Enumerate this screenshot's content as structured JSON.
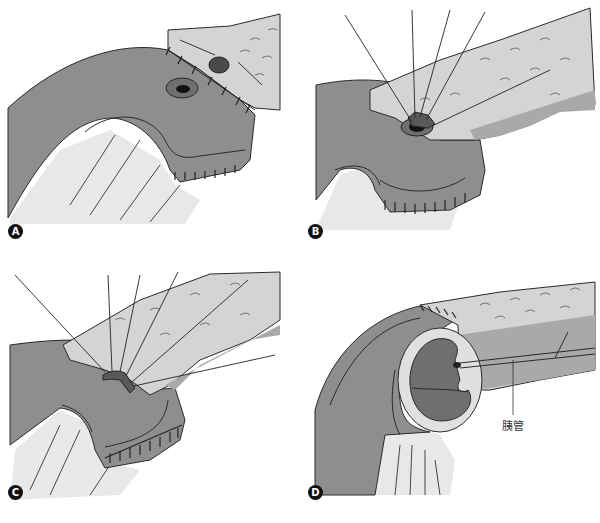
{
  "figure": {
    "panels": [
      {
        "id": "A",
        "label": "A",
        "description": "Jejunal limb with sutured pancreatic remnant; jejunal opening and pancreatic duct orifice"
      },
      {
        "id": "B",
        "label": "B",
        "description": "Duct-to-mucosa stitches placed radially around pancreatic duct"
      },
      {
        "id": "C",
        "label": "C",
        "description": "Stitches tied, anterior row completed"
      },
      {
        "id": "D",
        "label": "D",
        "description": "Cut-away view of completed anastomosis showing pancreatic duct"
      }
    ],
    "annotations": [
      {
        "panel": "D",
        "text": "胰管"
      }
    ],
    "colors": {
      "jejunum": "#8e8e8e",
      "jejunum_dark": "#6f6f6f",
      "pancreas": "#d4d4d4",
      "pancreas_shadow": "#a9a9a9",
      "mesentery": "#e8e8e8",
      "outline": "#2a2a2a",
      "badge": "#111111"
    }
  }
}
